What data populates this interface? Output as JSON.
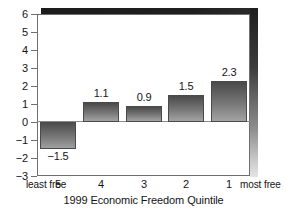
{
  "chart_data": {
    "type": "bar",
    "title": "",
    "xlabel": "1999 Economic Freedom Quintile",
    "ylabel": "",
    "categories": [
      "5",
      "4",
      "3",
      "2",
      "1"
    ],
    "category_end_labels": {
      "left": "least free",
      "right": "most free"
    },
    "values": [
      -1.5,
      1.1,
      0.9,
      1.5,
      2.3
    ],
    "value_labels": [
      "−1.5",
      "1.1",
      "0.9",
      "1.5",
      "2.3"
    ],
    "ylim": [
      -3,
      6
    ],
    "yticks": [
      6,
      5,
      4,
      3,
      2,
      1,
      0,
      -1,
      -2,
      -3
    ],
    "ytick_labels": [
      "6",
      "5",
      "4",
      "3",
      "2",
      "1",
      "0",
      "−1",
      "−2",
      "−3"
    ],
    "grid": false,
    "legend": null,
    "bar_style": "vertical-gradient-gray-3d",
    "colors": {
      "bar_top": "#4a4a4a",
      "bar_bottom": "#a3a3a3",
      "bar_border": "#4a4a4a",
      "frame": "#6f6f6f",
      "shadow_top": "#1c1c1c",
      "shadow_right_top": "#1e1e1e",
      "shadow_right_bottom": "#e4e4e4",
      "background": "#ffffff",
      "text": "#141414"
    }
  },
  "axis": {
    "x_title": "1999 Economic Freedom Quintile",
    "x_left_note": "least free",
    "x_right_note": "most free"
  }
}
